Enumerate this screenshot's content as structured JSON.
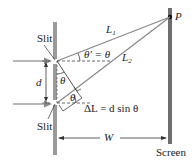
{
  "diagram": {
    "labels": {
      "slit_top": "Slit",
      "slit_bottom": "Slit",
      "point": "P",
      "L1": "L",
      "L1_sub": "1",
      "L2": "L",
      "L2_sub": "2",
      "theta_prime_eq": "θ′ = θ",
      "theta_upper": "θ",
      "theta_lower": "θ",
      "d": "d",
      "delta_L": "ΔL = d sin θ",
      "W": "W",
      "screen": "Screen"
    },
    "colors": {
      "barrier": "#9a9a9a",
      "screen": "#6e6e6e",
      "ray": "#888888",
      "arrow": "#888888",
      "text": "#222222"
    }
  }
}
